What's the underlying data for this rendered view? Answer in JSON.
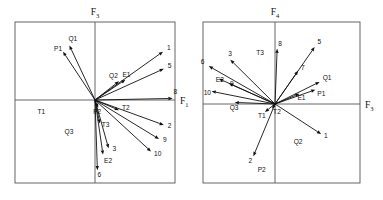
{
  "figure": {
    "background": "#ffffff",
    "line_color": "#111111",
    "frame_color": "#555555"
  },
  "chart_data": [
    {
      "type": "scatter",
      "title": "",
      "panel": "left",
      "xlabel": "F1",
      "ylabel": "F3",
      "xlabel_text": "F",
      "xlabel_sub": "1",
      "ylabel_text": "F",
      "ylabel_sub": "3",
      "xlim": [
        -1,
        1
      ],
      "ylim": [
        -1,
        1
      ],
      "grid": false,
      "legend": "none",
      "origin_px": [
        95,
        100
      ],
      "frame_px": [
        15,
        22,
        175,
        183
      ],
      "axis_note": "horizontal axis F1 through origin, vertical axis F3 through origin",
      "vectors": [
        {
          "label": "P1",
          "x": -0.4,
          "y": 0.62,
          "label_dx": -9,
          "label_dy": -1
        },
        {
          "label": "Q1",
          "x": -0.32,
          "y": 0.7,
          "label_dx": -1,
          "label_dy": -4
        },
        {
          "label": "1",
          "x": 0.85,
          "y": 0.62,
          "label_dx": 4,
          "label_dy": -2
        },
        {
          "label": "5",
          "x": 0.86,
          "y": 0.4,
          "label_dx": 4,
          "label_dy": -1
        },
        {
          "label": "8",
          "x": 0.97,
          "y": 0.02,
          "label_dx": 1,
          "label_dy": -4
        },
        {
          "label": "2",
          "x": 0.86,
          "y": -0.32,
          "label_dx": 4,
          "label_dy": 3
        },
        {
          "label": "9",
          "x": 0.8,
          "y": -0.5,
          "label_dx": 4,
          "label_dy": 3
        },
        {
          "label": "10",
          "x": 0.7,
          "y": -0.66,
          "label_dx": 3,
          "label_dy": 5
        },
        {
          "label": "3",
          "x": 0.17,
          "y": -0.62,
          "label_dx": 4,
          "label_dy": 3
        },
        {
          "label": "6",
          "x": 0.03,
          "y": -0.9,
          "label_dx": 0,
          "label_dy": 7
        },
        {
          "label": "E2",
          "x": 0.1,
          "y": -0.7,
          "label_dx": 1,
          "label_dy": 8
        },
        {
          "label": "T3",
          "x": 0.06,
          "y": -0.3,
          "label_dx": 2,
          "label_dy": 4
        },
        {
          "label": "T2",
          "x": 0.3,
          "y": -0.13,
          "label_dx": 3,
          "label_dy": 0
        },
        {
          "label": "E1",
          "x": 0.38,
          "y": 0.26,
          "label_dx": -3,
          "label_dy": -3
        },
        {
          "label": "Q2",
          "x": 0.3,
          "y": 0.24,
          "label_dx": -10,
          "label_dy": -3
        },
        {
          "label": "P2",
          "x": 0.04,
          "y": -0.1,
          "label_dx": -5,
          "label_dy": 6
        }
      ],
      "quadrant_labels": [
        {
          "label": "T1",
          "x": -0.72,
          "y": -0.18
        },
        {
          "label": "Q3",
          "x": -0.38,
          "y": -0.44
        }
      ]
    },
    {
      "type": "scatter",
      "title": "",
      "panel": "right",
      "xlabel": "F3",
      "ylabel": "F4",
      "xlabel_text": "F",
      "xlabel_sub": "3",
      "ylabel_text": "F",
      "ylabel_sub": "4",
      "xlim": [
        -1,
        1
      ],
      "ylim": [
        -1,
        1
      ],
      "grid": false,
      "legend": "none",
      "origin_px": [
        275,
        104
      ],
      "frame_px": [
        203,
        22,
        360,
        183
      ],
      "axis_note": "horizontal axis F3 through origin, vertical axis F4 through origin",
      "vectors": [
        {
          "label": "5",
          "x": 0.55,
          "y": 0.72,
          "label_dx": 3,
          "label_dy": -3
        },
        {
          "label": "8",
          "x": 0.03,
          "y": 0.7,
          "label_dx": 1,
          "label_dy": -3
        },
        {
          "label": "7",
          "x": 0.32,
          "y": 0.42,
          "label_dx": 3,
          "label_dy": -1
        },
        {
          "label": "Q1",
          "x": 0.62,
          "y": 0.28,
          "label_dx": 3,
          "label_dy": -2
        },
        {
          "label": "P1",
          "x": 0.56,
          "y": 0.18,
          "label_dx": 2,
          "label_dy": 6
        },
        {
          "label": "E1",
          "x": 0.34,
          "y": 0.13,
          "label_dx": -2,
          "label_dy": 6
        },
        {
          "label": "3",
          "x": -0.62,
          "y": 0.56,
          "label_dx": -2,
          "label_dy": -4
        },
        {
          "label": "6",
          "x": -0.92,
          "y": 0.48,
          "label_dx": -8,
          "label_dy": -2
        },
        {
          "label": "E2",
          "x": -0.78,
          "y": 0.32,
          "label_dx": -3,
          "label_dy": 3
        },
        {
          "label": "9",
          "x": -0.64,
          "y": 0.26,
          "label_dx": 1,
          "label_dy": 3
        },
        {
          "label": "10",
          "x": -0.88,
          "y": 0.16,
          "label_dx": -8,
          "label_dy": 4
        },
        {
          "label": "Q3",
          "x": -0.56,
          "y": 0.02,
          "label_dx": -5,
          "label_dy": 8
        },
        {
          "label": "1",
          "x": 0.64,
          "y": -0.38,
          "label_dx": 3,
          "label_dy": 4
        },
        {
          "label": "2",
          "x": -0.3,
          "y": -0.66,
          "label_dx": -5,
          "label_dy": 7
        },
        {
          "label": "T1",
          "x": -0.14,
          "y": -0.1,
          "label_dx": -7,
          "label_dy": 6
        },
        {
          "label": "T2",
          "x": -0.04,
          "y": -0.06,
          "label_dx": 1,
          "label_dy": 5
        }
      ],
      "quadrant_labels": [
        {
          "label": "T3",
          "x": -0.26,
          "y": 0.62
        },
        {
          "label": "Q2",
          "x": 0.26,
          "y": -0.5
        },
        {
          "label": "P2",
          "x": -0.24,
          "y": -0.86
        }
      ]
    }
  ]
}
